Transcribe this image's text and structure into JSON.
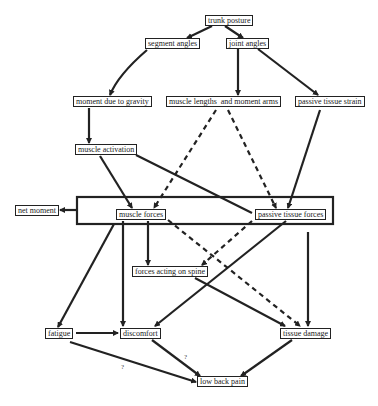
{
  "diagram": {
    "nodes": {
      "trunk_posture": "trunk posture",
      "segment_angles": "segment angles",
      "joint_angles": "joint angles",
      "moment_due_to_gravity": "moment due to gravity",
      "muscle_lengths_and_moment_arms": "muscle lengths  and moment arms",
      "passive_tissue_strain": "passive tissue strain",
      "muscle_activation": "muscle activation",
      "net_moment": "net moment",
      "muscle_forces": "muscle forces",
      "passive_tissue_forces": "passive tissue forces",
      "forces_acting_on_spine": "forces acting on spine",
      "fatigue": "fatigue",
      "discomfort": "discomfort",
      "tissue_damage": "tissue damage",
      "low_back_pain": "low back pain"
    },
    "annotations": {
      "q1": "?",
      "q2": "?"
    },
    "colors": {
      "line": "#222222",
      "background": "#ffffff"
    },
    "edges": [
      {
        "from": "trunk posture",
        "to": "segment angles",
        "style": "solid"
      },
      {
        "from": "trunk posture",
        "to": "joint angles",
        "style": "solid"
      },
      {
        "from": "segment angles",
        "to": "moment due to gravity",
        "style": "solid"
      },
      {
        "from": "joint angles",
        "to": "muscle lengths and moment arms",
        "style": "solid"
      },
      {
        "from": "joint angles",
        "to": "passive tissue strain",
        "style": "solid"
      },
      {
        "from": "moment due to gravity",
        "to": "muscle activation",
        "style": "solid"
      },
      {
        "from": "muscle lengths and moment arms",
        "to": "muscle forces",
        "style": "dashed"
      },
      {
        "from": "muscle lengths and moment arms",
        "to": "passive tissue forces",
        "style": "dashed"
      },
      {
        "from": "passive tissue strain",
        "to": "passive tissue forces",
        "style": "solid"
      },
      {
        "from": "muscle activation",
        "to": "muscle forces",
        "style": "solid"
      },
      {
        "from": "muscle activation",
        "to": "passive tissue forces",
        "style": "solid"
      },
      {
        "from": "force group",
        "to": "net moment",
        "style": "solid"
      },
      {
        "from": "muscle forces",
        "to": "forces acting on spine",
        "style": "solid"
      },
      {
        "from": "muscle forces",
        "to": "fatigue",
        "style": "solid"
      },
      {
        "from": "muscle forces",
        "to": "discomfort",
        "style": "solid"
      },
      {
        "from": "muscle forces",
        "to": "tissue damage",
        "style": "dashed"
      },
      {
        "from": "passive tissue forces",
        "to": "forces acting on spine",
        "style": "dashed"
      },
      {
        "from": "passive tissue forces",
        "to": "discomfort",
        "style": "solid"
      },
      {
        "from": "force group",
        "to": "tissue damage",
        "style": "solid"
      },
      {
        "from": "forces acting on spine",
        "to": "tissue damage",
        "style": "solid"
      },
      {
        "from": "fatigue",
        "to": "discomfort",
        "style": "solid"
      },
      {
        "from": "fatigue",
        "to": "low back pain",
        "style": "solid",
        "label": "?"
      },
      {
        "from": "discomfort",
        "to": "low back pain",
        "style": "solid",
        "label": "?"
      },
      {
        "from": "tissue damage",
        "to": "low back pain",
        "style": "solid"
      }
    ]
  }
}
